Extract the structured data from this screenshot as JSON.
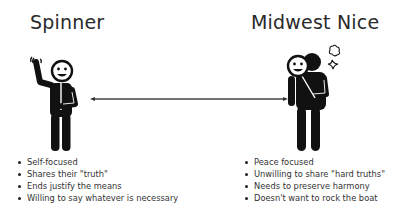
{
  "left": {
    "title": "Spinner",
    "figure": "waving-smiling-person-icon",
    "bullets": [
      "Self-focused",
      "Shares their \"truth\"",
      "Ends justify the means",
      "Willing to say whatever is necessary"
    ]
  },
  "right": {
    "title": "Midwest Nice",
    "figure": "person-holding-smiling-mask-icon",
    "bullets": [
      "Peace focused",
      "Unwilling to share \"hard truths\"",
      "Needs to preserve harmony",
      "Doesn't want to rock the boat"
    ]
  },
  "connector": {
    "type": "double-headed-arrow",
    "color": "#444444"
  },
  "colors": {
    "text": "#2a2a2a",
    "figure": "#111111",
    "background": "#ffffff"
  }
}
